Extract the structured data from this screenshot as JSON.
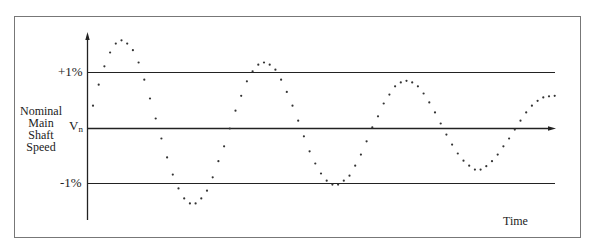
{
  "chart_data": {
    "type": "scatter",
    "title": "",
    "xlabel": "Time",
    "ylabel": "Nominal Main Shaft Speed",
    "ylabel_lines": [
      "Nominal",
      "Main",
      "Shaft",
      "Speed"
    ],
    "y_reference_lines": [
      {
        "label": "+1%",
        "value": 1
      },
      {
        "label": "Vn",
        "value": 0
      },
      {
        "label": "-1%",
        "value": -1
      }
    ],
    "ylim": [
      -1.65,
      1.7
    ],
    "grid": false,
    "legend": null,
    "x": [
      0,
      1,
      2,
      3,
      4,
      5,
      6,
      7,
      8,
      9,
      10,
      11,
      12,
      13,
      14,
      15,
      16,
      17,
      18,
      19,
      20,
      21,
      22,
      23,
      24,
      25,
      26,
      27,
      28,
      29,
      30,
      31,
      32,
      33,
      34,
      35,
      36,
      37,
      38,
      39,
      40,
      41,
      42,
      43,
      44,
      45,
      46,
      47,
      48,
      49,
      50,
      51,
      52,
      53,
      54,
      55,
      56,
      57,
      58,
      59,
      60,
      61,
      62,
      63,
      64,
      65,
      66,
      67,
      68,
      69,
      70,
      71,
      72,
      73,
      74,
      75,
      76,
      77,
      78,
      79,
      80,
      81
    ],
    "values": [
      0.41,
      0.79,
      1.12,
      1.37,
      1.53,
      1.59,
      1.53,
      1.41,
      1.19,
      0.88,
      0.54,
      0.18,
      -0.18,
      -0.52,
      -0.83,
      -1.08,
      -1.26,
      -1.35,
      -1.35,
      -1.26,
      -1.12,
      -0.88,
      -0.59,
      -0.32,
      0.0,
      0.32,
      0.59,
      0.85,
      1.03,
      1.15,
      1.19,
      1.15,
      1.06,
      0.88,
      0.66,
      0.41,
      0.14,
      -0.14,
      -0.41,
      -0.63,
      -0.81,
      -0.94,
      -1.01,
      -1.01,
      -0.94,
      -0.85,
      -0.67,
      -0.47,
      -0.23,
      0.02,
      0.22,
      0.45,
      0.61,
      0.76,
      0.83,
      0.86,
      0.83,
      0.76,
      0.63,
      0.47,
      0.29,
      0.09,
      -0.11,
      -0.29,
      -0.45,
      -0.58,
      -0.67,
      -0.74,
      -0.74,
      -0.68,
      -0.59,
      -0.47,
      -0.32,
      -0.18,
      -0.02,
      0.14,
      0.29,
      0.41,
      0.5,
      0.56,
      0.58,
      0.59
    ]
  },
  "labels": {
    "plus_one": "+1%",
    "minus_one": "-1%",
    "vn_main": "V",
    "vn_sub": "n",
    "time": "Time"
  },
  "colors": {
    "line": "#222222",
    "dot": "#333333",
    "frame": "#777777"
  }
}
